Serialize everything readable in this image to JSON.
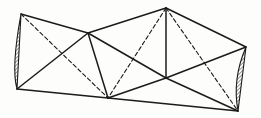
{
  "figure": {
    "type": "geometric-net-diagram",
    "canvas": {
      "width": 261,
      "height": 118
    },
    "colors": {
      "background": "#fdfdfb",
      "stroke": "#1b1b1b"
    },
    "style": {
      "solid_stroke_width": 1.5,
      "dashed_stroke_width": 1.1,
      "dash_pattern": "4 2.6",
      "sliver_stroke_width": 1.1,
      "hatch_spacing": 2.6,
      "hatch_stroke_width": 0.9
    },
    "vertices": {
      "A": [
        21,
        14
      ],
      "B": [
        88,
        33
      ],
      "C": [
        166,
        8
      ],
      "D": [
        246,
        47
      ],
      "E": [
        238,
        111
      ],
      "F": [
        108,
        98
      ],
      "G": [
        17,
        89
      ],
      "H": [
        166,
        78
      ]
    },
    "solid_edges": [
      [
        "A",
        "B"
      ],
      [
        "B",
        "C"
      ],
      [
        "C",
        "D"
      ],
      [
        "G",
        "F"
      ],
      [
        "F",
        "E"
      ],
      [
        "G",
        "B"
      ],
      [
        "B",
        "F"
      ],
      [
        "B",
        "H"
      ],
      [
        "H",
        "E"
      ],
      [
        "H",
        "F"
      ],
      [
        "H",
        "D"
      ],
      [
        "C",
        "H"
      ]
    ],
    "dashed_edges": [
      [
        "A",
        "F"
      ],
      [
        "C",
        "F"
      ],
      [
        "C",
        "E"
      ]
    ],
    "slivers": [
      {
        "from": "A",
        "to": "G",
        "control": [
          11,
          68
        ]
      },
      {
        "from": "D",
        "to": "E",
        "control": [
          232,
          79
        ]
      }
    ]
  }
}
